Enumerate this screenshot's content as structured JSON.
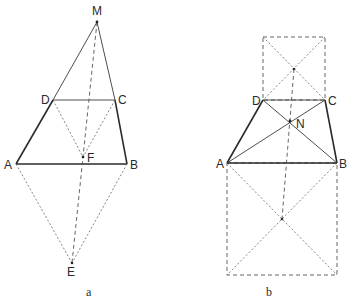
{
  "figures": [
    {
      "caption": "a",
      "points": {
        "M": {
          "label": "M",
          "x": 97,
          "y": 22
        },
        "D": {
          "label": "D",
          "x": 53,
          "y": 100
        },
        "C": {
          "label": "C",
          "x": 115,
          "y": 100
        },
        "A": {
          "label": "A",
          "x": 16,
          "y": 164
        },
        "B": {
          "label": "B",
          "x": 127,
          "y": 164
        },
        "F": {
          "label": "F",
          "x": 83,
          "y": 157
        },
        "E": {
          "label": "E",
          "x": 72,
          "y": 263
        }
      }
    },
    {
      "caption": "b",
      "points": {
        "D": {
          "label": "D",
          "x": 263,
          "y": 100
        },
        "C": {
          "label": "C",
          "x": 325,
          "y": 100
        },
        "N": {
          "label": "N",
          "x": 290,
          "y": 121
        },
        "A": {
          "label": "A",
          "x": 227,
          "y": 163
        },
        "B": {
          "label": "B",
          "x": 337,
          "y": 163
        }
      }
    }
  ]
}
